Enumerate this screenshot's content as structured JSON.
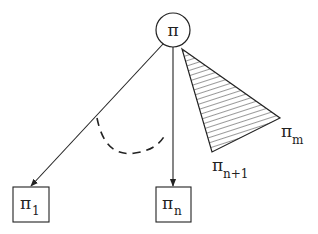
{
  "diagram": {
    "root": {
      "label": "π",
      "shape": "circle"
    },
    "children": [
      {
        "label": "π",
        "subscript": "1",
        "shape": "box"
      },
      {
        "label": "π",
        "subscript": "n",
        "shape": "box"
      }
    ],
    "subtree": {
      "shape": "hatched-triangle",
      "labels": [
        {
          "label": "π",
          "subscript": "n+1"
        },
        {
          "label": "π",
          "subscript": "m"
        }
      ]
    },
    "ellipsis_arc": "dashed",
    "colors": {
      "stroke": "#222222",
      "background": "#ffffff"
    }
  }
}
